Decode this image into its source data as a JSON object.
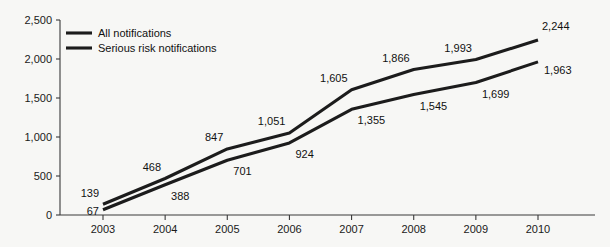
{
  "chart_data": {
    "type": "line",
    "title": "",
    "subtitle": "",
    "xlabel": "",
    "ylabel": "",
    "categories": [
      "2003",
      "2004",
      "2005",
      "2006",
      "2007",
      "2008",
      "2009",
      "2010"
    ],
    "x": [
      2003,
      2004,
      2005,
      2006,
      2007,
      2008,
      2009,
      2010
    ],
    "series": [
      {
        "name": "All notifications",
        "color": "#1c1c1c",
        "values": [
          139,
          468,
          847,
          1051,
          1605,
          1866,
          1993,
          2244
        ],
        "value_labels": [
          "139",
          "468",
          "847",
          "1,051",
          "1,605",
          "1,866",
          "1,993",
          "2,244"
        ]
      },
      {
        "name": "Serious risk notifications",
        "color": "#1c1c1c",
        "values": [
          67,
          388,
          701,
          924,
          1355,
          1545,
          1699,
          1963
        ],
        "value_labels": [
          "67",
          "388",
          "701",
          "924",
          "1,355",
          "1,545",
          "1,699",
          "1,963"
        ]
      }
    ],
    "ylim": [
      0,
      2500
    ],
    "yticks": [
      0,
      500,
      1000,
      1500,
      2000,
      2500
    ],
    "ytick_labels": [
      "0",
      "500",
      "1,000",
      "1,500",
      "2,000",
      "2,500"
    ],
    "xtick_labels": [
      "2003",
      "2004",
      "2005",
      "2006",
      "2007",
      "2008",
      "2009",
      "2010"
    ],
    "grid": false,
    "legend_position": "top-left",
    "legend_entries": [
      "All notifications",
      "Serious risk notifications"
    ],
    "background_color": "#f7f7f5",
    "axis_color": "#3a3a3a",
    "label_color": "#111111"
  }
}
